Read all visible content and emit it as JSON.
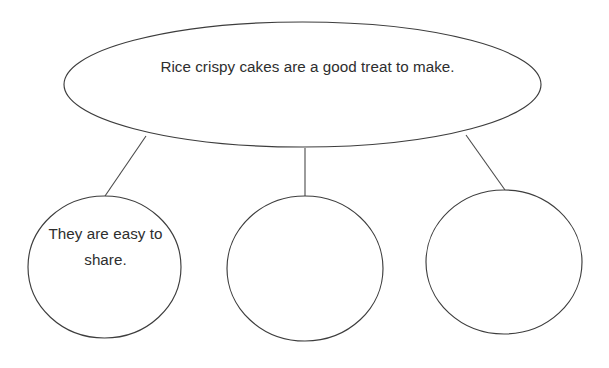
{
  "diagram": {
    "type": "concept-map",
    "background_color": "#ffffff",
    "stroke_color": "#3d3d3d",
    "text_color": "#2e2e2e",
    "main_idea": {
      "shape": "ellipse",
      "label": "Rice crispy cakes are a good treat to make."
    },
    "branches": [
      {
        "shape": "circle",
        "label": "They are easy to share.",
        "connector": "diagonal-left"
      },
      {
        "shape": "circle",
        "label": "",
        "connector": "vertical"
      },
      {
        "shape": "circle",
        "label": "",
        "connector": "diagonal-right"
      }
    ]
  }
}
